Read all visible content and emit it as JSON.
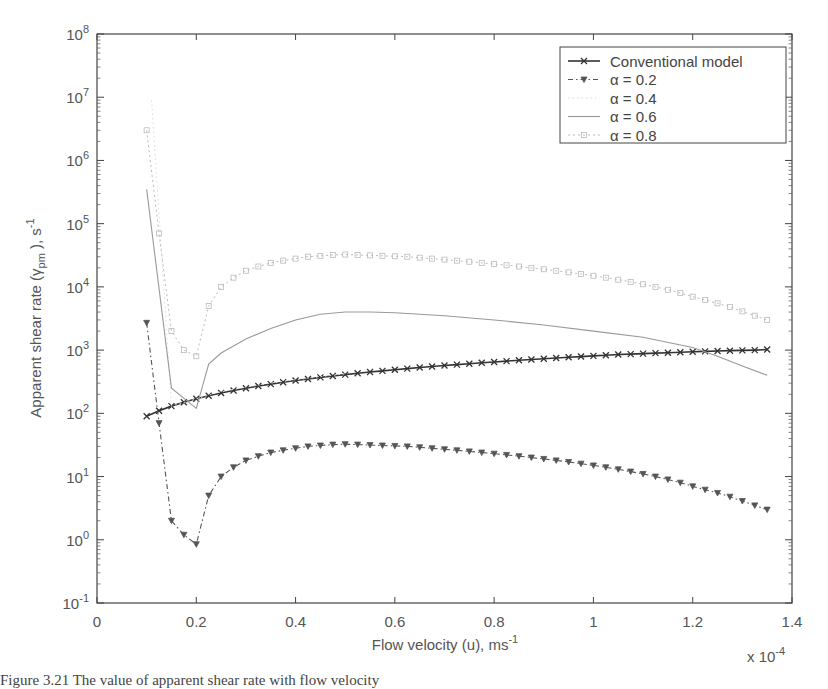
{
  "chart_data": {
    "type": "line",
    "title": "",
    "xlabel": "Flow velocity (u), ms",
    "xlabel_sup": "-1",
    "x_multiplier": "x 10",
    "x_multiplier_sup": "-4",
    "ylabel": "Apparent shear rate (γ",
    "ylabel_sub": "pm",
    "ylabel_tail": " ), s",
    "ylabel_sup": "-1",
    "yscale": "log",
    "xlim": [
      0,
      1.4
    ],
    "ylim": [
      0.1,
      100000000
    ],
    "xticks": [
      "0",
      "0.2",
      "0.4",
      "0.6",
      "0.8",
      "1",
      "1.2",
      "1.4"
    ],
    "yticks": [
      {
        "base": "10",
        "exp": "8"
      },
      {
        "base": "10",
        "exp": "7"
      },
      {
        "base": "10",
        "exp": "6"
      },
      {
        "base": "10",
        "exp": "5"
      },
      {
        "base": "10",
        "exp": "4"
      },
      {
        "base": "10",
        "exp": "3"
      },
      {
        "base": "10",
        "exp": "2"
      },
      {
        "base": "10",
        "exp": "1"
      },
      {
        "base": "10",
        "exp": "0"
      },
      {
        "base": "10",
        "exp": "-1"
      }
    ],
    "grid": false,
    "legend_position": "upper right",
    "series": [
      {
        "name": "Conventional model",
        "style": "solid-x",
        "color": "#333333",
        "x": [
          0.1,
          0.125,
          0.15,
          0.175,
          0.2,
          0.225,
          0.25,
          0.275,
          0.3,
          0.325,
          0.35,
          0.375,
          0.4,
          0.425,
          0.45,
          0.475,
          0.5,
          0.525,
          0.55,
          0.575,
          0.6,
          0.625,
          0.65,
          0.675,
          0.7,
          0.725,
          0.75,
          0.775,
          0.8,
          0.825,
          0.85,
          0.875,
          0.9,
          0.925,
          0.95,
          0.975,
          1.0,
          1.025,
          1.05,
          1.075,
          1.1,
          1.125,
          1.15,
          1.175,
          1.2,
          1.225,
          1.25,
          1.275,
          1.3,
          1.325,
          1.35
        ],
        "y": [
          90,
          110,
          130,
          150,
          170,
          190,
          210,
          230,
          250,
          270,
          290,
          310,
          330,
          350,
          370,
          390,
          410,
          430,
          450,
          470,
          490,
          510,
          530,
          550,
          570,
          590,
          610,
          630,
          650,
          670,
          690,
          710,
          730,
          750,
          770,
          790,
          810,
          830,
          850,
          865,
          880,
          895,
          910,
          925,
          940,
          955,
          970,
          980,
          990,
          1000,
          1020
        ]
      },
      {
        "name": "α = 0.2",
        "style": "dashdot-triangle",
        "color": "#555555",
        "x": [
          0.1,
          0.125,
          0.15,
          0.175,
          0.2,
          0.225,
          0.25,
          0.275,
          0.3,
          0.325,
          0.35,
          0.375,
          0.4,
          0.425,
          0.45,
          0.475,
          0.5,
          0.525,
          0.55,
          0.575,
          0.6,
          0.625,
          0.65,
          0.675,
          0.7,
          0.725,
          0.75,
          0.775,
          0.8,
          0.825,
          0.85,
          0.875,
          0.9,
          0.925,
          0.95,
          0.975,
          1.0,
          1.025,
          1.05,
          1.075,
          1.1,
          1.125,
          1.15,
          1.175,
          1.2,
          1.225,
          1.25,
          1.275,
          1.3,
          1.325,
          1.35
        ],
        "y": [
          2700,
          70,
          2,
          1.2,
          0.85,
          5,
          10,
          14,
          18,
          21,
          24,
          26,
          28,
          30,
          31,
          32,
          32.5,
          32,
          31.5,
          31,
          30.5,
          30,
          29,
          28,
          27,
          26,
          25,
          24,
          23,
          22,
          21,
          20,
          19,
          18,
          17,
          16,
          15,
          14,
          13,
          12,
          11,
          10,
          9,
          8,
          7,
          6.2,
          5.5,
          4.8,
          4.1,
          3.5,
          3
        ]
      },
      {
        "name": "α = 0.4",
        "style": "dotted-faint",
        "color": "#dddddd",
        "x": [
          0.11,
          0.15,
          0.2,
          0.25,
          0.3,
          0.35,
          0.4,
          0.45,
          0.5
        ],
        "y": [
          9000000,
          130,
          170,
          220,
          260,
          300,
          340,
          380,
          420
        ]
      },
      {
        "name": "α = 0.6",
        "style": "solid-light",
        "color": "#999999",
        "x": [
          0.1,
          0.15,
          0.2,
          0.225,
          0.25,
          0.3,
          0.35,
          0.4,
          0.45,
          0.5,
          0.55,
          0.6,
          0.7,
          0.8,
          0.9,
          1.0,
          1.1,
          1.2,
          1.25,
          1.3,
          1.35
        ],
        "y": [
          350000,
          250,
          120,
          600,
          900,
          1500,
          2200,
          3000,
          3700,
          4000,
          4000,
          3900,
          3500,
          3000,
          2500,
          2000,
          1600,
          1100,
          800,
          560,
          400
        ]
      },
      {
        "name": "α = 0.8",
        "style": "dotted-square-light",
        "color": "#bbbbbb",
        "x": [
          0.1,
          0.125,
          0.15,
          0.175,
          0.2,
          0.225,
          0.25,
          0.275,
          0.3,
          0.325,
          0.35,
          0.375,
          0.4,
          0.425,
          0.45,
          0.475,
          0.5,
          0.525,
          0.55,
          0.575,
          0.6,
          0.625,
          0.65,
          0.675,
          0.7,
          0.725,
          0.75,
          0.775,
          0.8,
          0.825,
          0.85,
          0.875,
          0.9,
          0.925,
          0.95,
          0.975,
          1.0,
          1.025,
          1.05,
          1.075,
          1.1,
          1.125,
          1.15,
          1.175,
          1.2,
          1.225,
          1.25,
          1.275,
          1.3,
          1.325,
          1.35
        ],
        "y": [
          3000000,
          70000,
          2000,
          1000,
          800,
          5000,
          10000,
          14000,
          18000,
          21000,
          24000,
          26000,
          28000,
          30000,
          31000,
          32000,
          32500,
          32000,
          31500,
          31000,
          30500,
          30000,
          29000,
          28000,
          27000,
          26000,
          25000,
          24000,
          23000,
          22000,
          21000,
          20000,
          19000,
          18000,
          17000,
          16000,
          15000,
          14000,
          13000,
          12000,
          11000,
          10000,
          9000,
          8000,
          7000,
          6200,
          5500,
          4800,
          4100,
          3500,
          3000
        ]
      }
    ]
  },
  "caption": "Figure 3.21  The value of apparent shear rate with flow velocity"
}
